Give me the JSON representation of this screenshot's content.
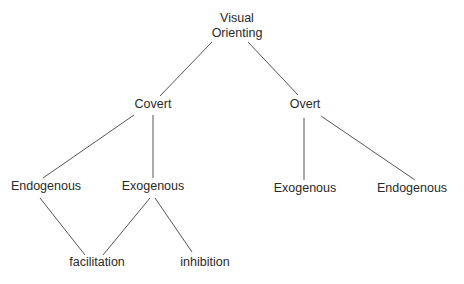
{
  "diagram": {
    "type": "tree",
    "nodes": [
      {
        "id": "root",
        "lines": [
          "Visual",
          "Orienting"
        ]
      },
      {
        "id": "covert",
        "lines": [
          "Covert"
        ],
        "parent": "root"
      },
      {
        "id": "overt",
        "lines": [
          "Overt"
        ],
        "parent": "root"
      },
      {
        "id": "covert-endogenous",
        "lines": [
          "Endogenous"
        ],
        "parent": "covert"
      },
      {
        "id": "covert-exogenous",
        "lines": [
          "Exogenous"
        ],
        "parent": "covert"
      },
      {
        "id": "overt-exogenous",
        "lines": [
          "Exogenous"
        ],
        "parent": "overt"
      },
      {
        "id": "overt-endogenous",
        "lines": [
          "Endogenous"
        ],
        "parent": "overt"
      },
      {
        "id": "facilitation",
        "lines": [
          "facilitation"
        ],
        "parents": [
          "covert-endogenous",
          "covert-exogenous"
        ]
      },
      {
        "id": "inhibition",
        "lines": [
          "inhibition"
        ],
        "parent": "covert-exogenous"
      }
    ],
    "edges": [
      [
        "root",
        "covert"
      ],
      [
        "root",
        "overt"
      ],
      [
        "covert",
        "covert-endogenous"
      ],
      [
        "covert",
        "covert-exogenous"
      ],
      [
        "overt",
        "overt-exogenous"
      ],
      [
        "overt",
        "overt-endogenous"
      ],
      [
        "covert-endogenous",
        "facilitation"
      ],
      [
        "covert-exogenous",
        "facilitation"
      ],
      [
        "covert-exogenous",
        "inhibition"
      ]
    ],
    "colors": {
      "line": "#555555",
      "text": "#2a2a2a",
      "background": "#ffffff"
    }
  }
}
